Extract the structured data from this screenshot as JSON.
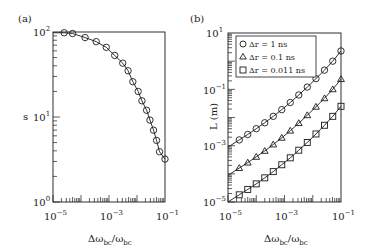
{
  "figure": {
    "panels": [
      {
        "label": "(a)",
        "ylabel": "s",
        "xlabel_main": "Δω",
        "xlabel_sub": "bc",
        "xlabel_div": "/ω",
        "xlabel_sub2": "bc"
      },
      {
        "label": "(b)",
        "ylabel": "L (m)",
        "xlabel_main": "Δω",
        "xlabel_sub": "bc",
        "xlabel_div": "/ω",
        "xlabel_sub2": "bc"
      }
    ],
    "ticks_a": {
      "x": [
        {
          "base": "10",
          "exp": "−5"
        },
        {
          "base": "10",
          "exp": "−3"
        },
        {
          "base": "10",
          "exp": "−1"
        }
      ],
      "y": [
        {
          "base": "10",
          "exp": "0"
        },
        {
          "base": "10",
          "exp": "1"
        },
        {
          "base": "10",
          "exp": "2"
        }
      ]
    },
    "ticks_b": {
      "x": [
        {
          "base": "10",
          "exp": "−5"
        },
        {
          "base": "10",
          "exp": "−3"
        },
        {
          "base": "10",
          "exp": "−1"
        }
      ],
      "y": [
        {
          "base": "10",
          "exp": "−5"
        },
        {
          "base": "10",
          "exp": "−3"
        },
        {
          "base": "10",
          "exp": "−1"
        },
        {
          "base": "10",
          "exp": "1"
        }
      ]
    },
    "legend_b": [
      {
        "marker": "circle",
        "text": "Δr = 1 ns"
      },
      {
        "marker": "triangle",
        "text": "Δr = 0.1 ns"
      },
      {
        "marker": "square",
        "text": "Δr = 0.011 ns"
      }
    ]
  },
  "chart_data": [
    {
      "type": "scatter",
      "title": "(a)",
      "xlabel": "Δω_bc/ω_bc",
      "ylabel": "s",
      "xscale": "log",
      "yscale": "log",
      "xlim": [
        1e-05,
        0.1
      ],
      "ylim": [
        1,
        100
      ],
      "grid": false,
      "series": [
        {
          "name": "s (markers: circles, with solid fit line)",
          "marker": "circle",
          "x": [
            2.5e-05,
            5e-05,
            0.00014,
            0.00035,
            0.0008,
            0.0016,
            0.0031,
            0.0048,
            0.0071,
            0.011,
            0.015,
            0.022,
            0.029,
            0.039,
            0.05,
            0.064,
            0.1
          ],
          "y": [
            98,
            96,
            86,
            77,
            66,
            53,
            43,
            35,
            26,
            20,
            15.5,
            12,
            9.2,
            7.0,
            5.3,
            3.9,
            3.2
          ]
        }
      ]
    },
    {
      "type": "scatter",
      "title": "(b)",
      "xlabel": "Δω_bc/ω_bc",
      "ylabel": "L (m)",
      "xscale": "log",
      "yscale": "log",
      "xlim": [
        1e-05,
        0.1
      ],
      "ylim": [
        1e-05,
        10
      ],
      "grid": false,
      "legend_position": "upper left",
      "series": [
        {
          "name": "Δr = 1 ns",
          "marker": "circle",
          "x": [
            2.5e-05,
            5e-05,
            0.0001,
            0.0002,
            0.0004,
            0.0008,
            0.0016,
            0.0032,
            0.0064,
            0.013,
            0.026,
            0.051,
            0.1
          ],
          "y": [
            0.0016,
            0.0025,
            0.004,
            0.0065,
            0.011,
            0.019,
            0.034,
            0.063,
            0.12,
            0.24,
            0.48,
            1.0,
            2.3
          ]
        },
        {
          "name": "Δr = 0.1 ns",
          "marker": "triangle",
          "x": [
            2.5e-05,
            5e-05,
            0.0001,
            0.0002,
            0.0004,
            0.0008,
            0.0016,
            0.0032,
            0.0064,
            0.013,
            0.026,
            0.051,
            0.1
          ],
          "y": [
            0.00016,
            0.00025,
            0.0004,
            0.00065,
            0.0011,
            0.0019,
            0.0034,
            0.0063,
            0.012,
            0.024,
            0.048,
            0.1,
            0.23
          ]
        },
        {
          "name": "Δr = 0.011 ns",
          "marker": "square",
          "x": [
            2.5e-05,
            5e-05,
            0.0001,
            0.0002,
            0.0004,
            0.0008,
            0.0016,
            0.0032,
            0.0064,
            0.013,
            0.026,
            0.051,
            0.1
          ],
          "y": [
            1.8e-05,
            2.8e-05,
            4.4e-05,
            7.2e-05,
            0.00012,
            0.00021,
            0.00037,
            0.00069,
            0.0013,
            0.0026,
            0.0053,
            0.011,
            0.025
          ]
        }
      ]
    }
  ]
}
